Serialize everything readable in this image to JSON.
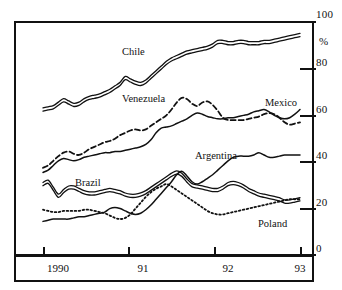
{
  "chart_data": {
    "type": "line",
    "title": "",
    "xlabel": "",
    "ylabel": "%",
    "ylim": [
      0,
      100
    ],
    "yticks": [
      0,
      20,
      40,
      60,
      80,
      100
    ],
    "ytick_labels": [
      "0",
      "20",
      "40",
      "60",
      "80",
      "100"
    ],
    "unit_label": "%",
    "xticks": [
      "1990",
      "91",
      "92",
      "93"
    ],
    "xtick_labels": [
      "1990",
      "91",
      "92",
      "93"
    ],
    "grid": false,
    "legend": "inline-labels",
    "axis_side": "right",
    "series": [
      {
        "name": "Chile",
        "style": "double-line",
        "label_x": 122,
        "label_y": 46,
        "x": [
          0,
          2,
          4,
          6,
          8,
          10,
          12,
          14,
          16,
          18,
          20,
          22,
          24,
          26,
          28,
          30,
          32,
          34,
          36,
          38,
          40,
          42,
          44,
          46,
          48,
          50,
          52,
          54,
          56,
          58,
          60,
          62,
          64,
          66,
          68,
          70,
          72,
          74,
          76,
          78,
          80,
          82,
          84,
          86,
          88,
          90,
          92,
          94,
          96,
          98,
          100
        ],
        "values": [
          62,
          62.5,
          63,
          64.5,
          66,
          65,
          64,
          64.5,
          66,
          67,
          67.5,
          68,
          69,
          70,
          71.5,
          73,
          75.5,
          74.5,
          73.5,
          73,
          74,
          76,
          78,
          80,
          82,
          83.5,
          84.5,
          85.5,
          86.5,
          87,
          87.5,
          88,
          88.5,
          89.5,
          91,
          91,
          90.5,
          90.5,
          91,
          91,
          90.5,
          90.5,
          90.5,
          91,
          91,
          91.5,
          92,
          92.5,
          93,
          93.5,
          94
        ]
      },
      {
        "name": "Venezuela",
        "style": "dashed",
        "label_x": 122,
        "label_y": 93,
        "x": [
          0,
          2,
          4,
          6,
          8,
          10,
          12,
          14,
          16,
          18,
          20,
          22,
          24,
          26,
          28,
          30,
          32,
          34,
          36,
          38,
          40,
          42,
          44,
          46,
          48,
          50,
          52,
          54,
          56,
          58,
          60,
          62,
          64,
          66,
          68,
          70,
          72,
          74,
          76,
          78,
          80,
          82,
          84,
          86,
          88,
          90,
          92,
          94,
          96,
          98,
          100
        ],
        "values": [
          37,
          38,
          40,
          42,
          43.5,
          44,
          43,
          42.5,
          43.5,
          45,
          46,
          47,
          48,
          48.5,
          49.5,
          51,
          52,
          53,
          53.5,
          53,
          53.5,
          55,
          56.5,
          58,
          59.5,
          62,
          65,
          67,
          66.5,
          64.5,
          63.5,
          65,
          65.5,
          64,
          61.5,
          58.5,
          57.5,
          57.5,
          57.5,
          57.5,
          58,
          58.5,
          59,
          60,
          60.5,
          60,
          58.5,
          56.5,
          55.5,
          56,
          56.5
        ]
      },
      {
        "name": "Mexico",
        "style": "solid",
        "label_x": 265,
        "label_y": 97,
        "x": [
          0,
          2,
          4,
          6,
          8,
          10,
          12,
          14,
          16,
          18,
          20,
          22,
          24,
          26,
          28,
          30,
          32,
          34,
          36,
          38,
          40,
          42,
          44,
          46,
          48,
          50,
          52,
          54,
          56,
          58,
          60,
          62,
          64,
          66,
          68,
          70,
          72,
          74,
          76,
          78,
          80,
          82,
          84,
          86,
          88,
          90,
          92,
          94,
          96,
          98,
          100
        ],
        "values": [
          35,
          36,
          38,
          40,
          41,
          40.5,
          40,
          40.5,
          41.5,
          42,
          42.5,
          43,
          43.5,
          43.5,
          44,
          44,
          44.5,
          45,
          45.5,
          46,
          47,
          49,
          52,
          54,
          54.5,
          55,
          56,
          57,
          58,
          59.5,
          60.5,
          60,
          59,
          58.5,
          58,
          58,
          58.5,
          58.5,
          59,
          59.5,
          60,
          61,
          61.5,
          62,
          61,
          59.5,
          58.5,
          58,
          58.5,
          60,
          62
        ]
      },
      {
        "name": "Argentina",
        "style": "solid",
        "label_x": 195,
        "label_y": 150,
        "x": [
          0,
          2,
          4,
          6,
          8,
          10,
          12,
          14,
          16,
          18,
          20,
          22,
          24,
          26,
          28,
          30,
          32,
          34,
          36,
          38,
          40,
          42,
          44,
          46,
          48,
          50,
          52,
          54,
          56,
          58,
          60,
          62,
          64,
          66,
          68,
          70,
          72,
          74,
          76,
          78,
          80,
          82,
          84,
          86,
          88,
          90,
          92,
          94,
          96,
          98,
          100
        ],
        "values": [
          14,
          14.5,
          15,
          15,
          15,
          15,
          15.5,
          16,
          16,
          16.5,
          17,
          17.5,
          18,
          19.5,
          20,
          19.5,
          18.5,
          17.5,
          17,
          17.5,
          19,
          21,
          23.5,
          26,
          28.5,
          31,
          34,
          35.5,
          33.5,
          31,
          30,
          31,
          32.5,
          34,
          36,
          38,
          40,
          41.5,
          42,
          42,
          42,
          42.5,
          43.5,
          42.5,
          41.5,
          41.5,
          42,
          42.5,
          42.5,
          42.5,
          42.5
        ]
      },
      {
        "name": "Brazil",
        "style": "double-line",
        "label_x": 75,
        "label_y": 177,
        "x": [
          0,
          2,
          4,
          6,
          8,
          10,
          12,
          14,
          16,
          18,
          20,
          22,
          24,
          26,
          28,
          30,
          32,
          34,
          36,
          38,
          40,
          42,
          44,
          46,
          48,
          50,
          52,
          54,
          56,
          58,
          60,
          62,
          64,
          66,
          68,
          70,
          72,
          74,
          76,
          78,
          80,
          82,
          84,
          86,
          88,
          90,
          92,
          94,
          96,
          98,
          100
        ],
        "values": [
          30,
          31,
          28,
          25,
          27,
          28.5,
          28.5,
          27.5,
          26.5,
          26,
          26,
          26.5,
          27,
          27.5,
          27,
          26.5,
          25.5,
          25,
          25,
          25.5,
          26.5,
          28,
          29.5,
          31,
          32.5,
          34,
          35,
          34,
          31.5,
          29.5,
          29,
          28.5,
          28,
          27.5,
          27.5,
          28.5,
          30,
          30.5,
          30,
          29,
          27.5,
          26.5,
          25.5,
          25,
          24.5,
          24,
          23.5,
          22.5,
          22.5,
          23,
          23.5
        ]
      },
      {
        "name": "Poland",
        "style": "dotted",
        "label_x": 258,
        "label_y": 218,
        "x": [
          0,
          2,
          4,
          6,
          8,
          10,
          12,
          14,
          16,
          18,
          20,
          22,
          24,
          26,
          28,
          30,
          32,
          34,
          36,
          38,
          40,
          42,
          44,
          46,
          48,
          50,
          52,
          54,
          56,
          58,
          60,
          62,
          64,
          66,
          68,
          70,
          72,
          74,
          76,
          78,
          80,
          82,
          84,
          86,
          88,
          90,
          92,
          94,
          96,
          98,
          100
        ],
        "values": [
          19,
          18.5,
          18,
          18,
          18.5,
          18.5,
          18.5,
          18.5,
          19,
          19,
          18.5,
          18,
          17.5,
          16.5,
          15.5,
          15,
          15.5,
          17,
          19.5,
          22,
          24.5,
          26.5,
          28,
          29,
          30,
          29,
          27.5,
          26,
          24.5,
          23,
          21.5,
          20,
          18.5,
          17.5,
          17,
          17,
          17.5,
          18,
          18.5,
          19,
          19.5,
          20,
          20.5,
          21,
          21.5,
          22,
          22.5,
          23,
          23.5,
          23.5,
          23.5
        ]
      }
    ]
  },
  "axis": {
    "y_labels": [
      "100",
      "80",
      "60",
      "40",
      "20",
      "0"
    ],
    "y_unit": "%",
    "x_labels": [
      "1990",
      "91",
      "92",
      "93"
    ]
  },
  "colors": {
    "line": "#111111",
    "frame": "#111111",
    "background": "#ffffff"
  }
}
